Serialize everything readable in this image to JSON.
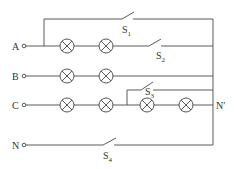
{
  "diagram": {
    "type": "circuit",
    "terminals": [
      {
        "id": "A",
        "label": "A"
      },
      {
        "id": "B",
        "label": "B"
      },
      {
        "id": "C",
        "label": "C"
      },
      {
        "id": "N",
        "label": "N"
      }
    ],
    "neutral_point": {
      "label": "N′"
    },
    "switches": [
      {
        "id": "S1",
        "label": "S",
        "sub": "1"
      },
      {
        "id": "S2",
        "label": "S",
        "sub": "2"
      },
      {
        "id": "S3",
        "label": "S",
        "sub": "3"
      },
      {
        "id": "S4",
        "label": "S",
        "sub": "4"
      }
    ],
    "lamps": [
      {
        "row": "A",
        "count": 2
      },
      {
        "row": "B",
        "count": 2
      },
      {
        "row": "C",
        "count": 4
      }
    ],
    "colors": {
      "line": "#5a5a5a",
      "background": "#ffffff"
    }
  }
}
